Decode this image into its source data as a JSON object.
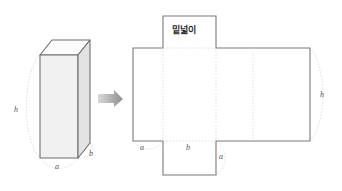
{
  "figure": {
    "title_text": "밑넓이",
    "background_color": "#ffffff",
    "solid": {
      "name": "rectangular-prism",
      "labels": {
        "height": "h",
        "width": "a",
        "depth": "b"
      },
      "fill_color": "#f2f2f2",
      "top_fill_color": "#fbfbfb",
      "side_fill_color": "#e4e4e4",
      "edge_color": "#6b6b6b",
      "hidden_edge_color": "#bdbdbd"
    },
    "arrow": {
      "name": "transform-arrow",
      "direction": "right",
      "color": "#9a9a9a"
    },
    "net": {
      "name": "prism-net",
      "outline_color": "#7a7a7a",
      "fold_line_color": "#cfcfcf",
      "arc_color": "#c9c9c9",
      "labels": {
        "top_face": "밑넓이",
        "left_width": "a",
        "front_width": "b",
        "right_width": "a",
        "height": "h"
      },
      "faces": [
        {
          "name": "top-flap",
          "label": "밑넓이"
        },
        {
          "name": "left-face",
          "label": "a"
        },
        {
          "name": "front-face",
          "label": "b"
        },
        {
          "name": "right-face",
          "label": "a"
        },
        {
          "name": "back-face",
          "label": ""
        },
        {
          "name": "bottom-flap",
          "label": ""
        }
      ]
    }
  }
}
